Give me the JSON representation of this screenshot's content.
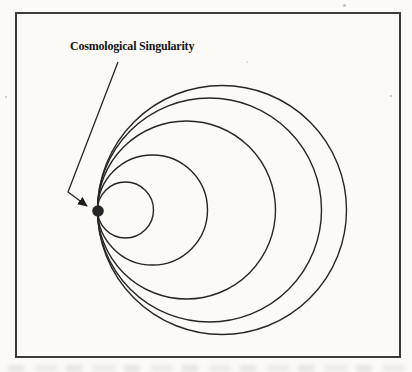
{
  "figure": {
    "label": "Cosmological Singularity",
    "colors": {
      "ink": "#262626",
      "dot": "#111111",
      "frame": "#3d3d3d",
      "paper": "#fbfaf7"
    },
    "frame": {
      "x": 16,
      "y": 13,
      "width": 384,
      "height": 344
    },
    "singularity": {
      "x": 98,
      "y": 211,
      "radius": 5.8
    },
    "circles": {
      "tangent_x": 97.5,
      "center_y": 210,
      "radii": [
        28,
        55,
        89,
        112,
        124.5
      ]
    },
    "arrow": {
      "points": [
        [
          118,
          62
        ],
        [
          68,
          192
        ],
        [
          87,
          206
        ]
      ]
    }
  }
}
